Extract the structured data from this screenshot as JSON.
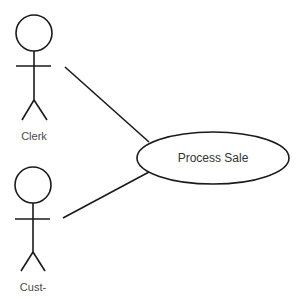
{
  "diagram": {
    "type": "uml-use-case",
    "actors": [
      {
        "id": "clerk",
        "label": "Clerk"
      },
      {
        "id": "customer",
        "label": "Cust-"
      }
    ],
    "use_cases": [
      {
        "id": "process-sale",
        "label": "Process Sale"
      }
    ],
    "associations": [
      {
        "from": "clerk",
        "to": "process-sale"
      },
      {
        "from": "customer",
        "to": "process-sale"
      }
    ],
    "colors": {
      "stroke": "#1a1a1a",
      "text": "#4a4a4a",
      "background": "#ffffff"
    }
  }
}
